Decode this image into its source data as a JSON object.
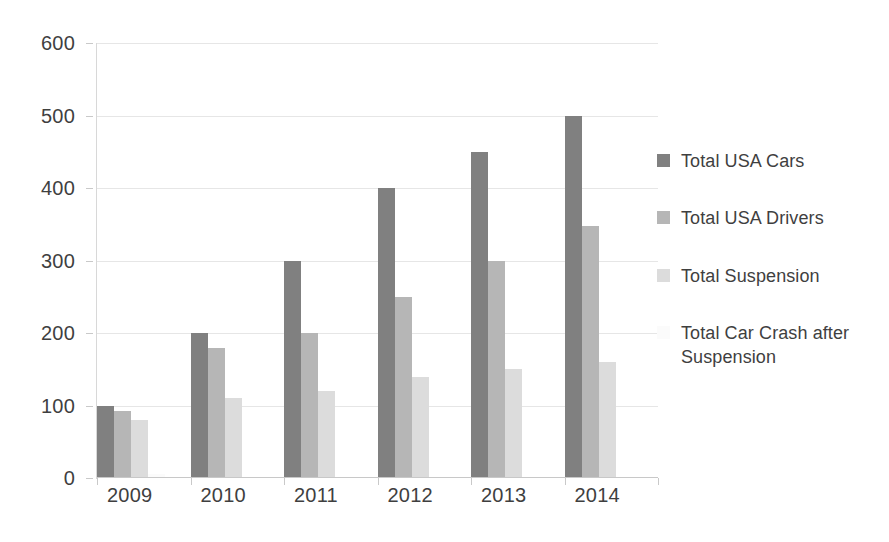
{
  "chart_data": {
    "type": "bar",
    "title": "",
    "subtitle": "",
    "xlabel": "",
    "ylabel": "",
    "categories": [
      "2009",
      "2010",
      "2011",
      "2012",
      "2013",
      "2014"
    ],
    "series": [
      {
        "name": "Total USA Cars",
        "color": "#808080",
        "values": [
          100,
          200,
          300,
          400,
          450,
          500
        ]
      },
      {
        "name": "Total USA Drivers",
        "color": "#b6b6b6",
        "values": [
          92,
          180,
          200,
          250,
          300,
          348
        ]
      },
      {
        "name": "Total Suspension",
        "color": "#dcdcdc",
        "values": [
          80,
          110,
          120,
          140,
          150,
          160
        ]
      },
      {
        "name": "Total Car Crash after Suspension",
        "color": "#fbfbfb",
        "values": [
          6,
          0,
          0,
          0,
          0,
          0
        ]
      }
    ],
    "ylim": [
      0,
      600
    ],
    "yticks": [
      0,
      100,
      200,
      300,
      400,
      500,
      600
    ],
    "ytick_labels": [
      "0",
      "100",
      "200",
      "300",
      "400",
      "500",
      "600"
    ],
    "grid": true,
    "legend_position": "right",
    "background_color": "#ffffff",
    "axis_label_color": "#3f3f3f",
    "gridline_color": "#e6e6e6"
  }
}
